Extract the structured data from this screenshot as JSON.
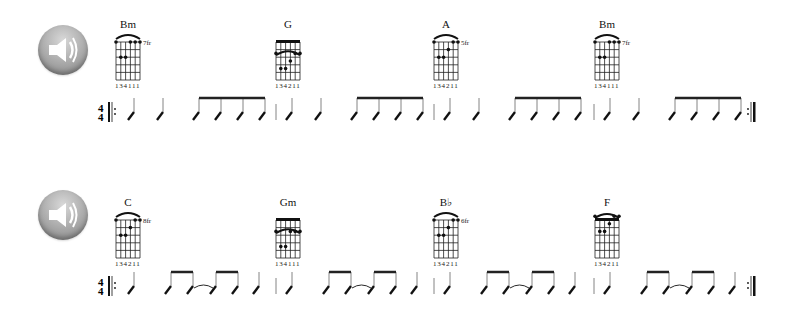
{
  "rows": [
    {
      "speaker": {
        "icon": "speaker-icon"
      },
      "time_signature": {
        "top": "4",
        "bottom": "4"
      },
      "chords": [
        {
          "name": "Bm",
          "fret_label": "7fr",
          "fingers": "134111",
          "nut": false,
          "barre": true,
          "dots": [
            [
              0,
              0
            ],
            [
              3,
              0
            ],
            [
              4,
              0
            ],
            [
              5,
              0
            ],
            [
              1,
              2
            ],
            [
              2,
              2
            ]
          ]
        },
        {
          "name": "G",
          "fret_label": "",
          "fingers": "134211",
          "nut": true,
          "barre": true,
          "dots": [
            [
              0,
              2
            ],
            [
              4,
              2
            ],
            [
              5,
              2
            ],
            [
              3,
              3
            ],
            [
              1,
              4
            ],
            [
              2,
              4
            ]
          ]
        },
        {
          "name": "A",
          "fret_label": "5fr",
          "fingers": "134211",
          "nut": false,
          "barre": true,
          "dots": [
            [
              0,
              0
            ],
            [
              4,
              0
            ],
            [
              5,
              0
            ],
            [
              3,
              1
            ],
            [
              1,
              2
            ],
            [
              2,
              2
            ]
          ]
        },
        {
          "name": "Bm",
          "fret_label": "7fr",
          "fingers": "134111",
          "nut": false,
          "barre": true,
          "dots": [
            [
              0,
              0
            ],
            [
              3,
              0
            ],
            [
              4,
              0
            ],
            [
              5,
              0
            ],
            [
              1,
              2
            ],
            [
              2,
              2
            ]
          ]
        }
      ],
      "rhythm": "quarter quarter | four-eighths-beamed per bar"
    },
    {
      "speaker": {
        "icon": "speaker-icon"
      },
      "time_signature": {
        "top": "4",
        "bottom": "4"
      },
      "chords": [
        {
          "name": "C",
          "fret_label": "8fr",
          "fingers": "134211",
          "nut": false,
          "barre": true,
          "dots": [
            [
              0,
              0
            ],
            [
              4,
              0
            ],
            [
              5,
              0
            ],
            [
              3,
              1
            ],
            [
              1,
              2
            ],
            [
              2,
              2
            ]
          ]
        },
        {
          "name": "Gm",
          "fret_label": "",
          "fingers": "134111",
          "nut": true,
          "barre": true,
          "dots": [
            [
              0,
              2
            ],
            [
              3,
              2
            ],
            [
              4,
              2
            ],
            [
              5,
              2
            ],
            [
              1,
              4
            ],
            [
              2,
              4
            ]
          ]
        },
        {
          "name": "B♭",
          "fret_label": "6fr",
          "fingers": "134211",
          "nut": false,
          "barre": true,
          "dots": [
            [
              0,
              0
            ],
            [
              4,
              0
            ],
            [
              5,
              0
            ],
            [
              3,
              1
            ],
            [
              1,
              2
            ],
            [
              2,
              2
            ]
          ]
        },
        {
          "name": "F",
          "fret_label": "",
          "fingers": "134211",
          "nut": true,
          "barre": true,
          "dots": [
            [
              0,
              0
            ],
            [
              4,
              0
            ],
            [
              5,
              0
            ],
            [
              3,
              1
            ],
            [
              1,
              2
            ],
            [
              2,
              2
            ]
          ]
        }
      ],
      "rhythm": "quarter | two-eighths tied two-eighths | quarter per bar"
    }
  ]
}
